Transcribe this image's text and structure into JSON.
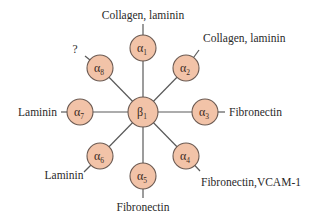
{
  "diagram": {
    "title": "",
    "colors": {
      "node_fill": "#f2c3a8",
      "node_stroke": "#6b5a52",
      "edge": "#5a5a5a",
      "text": "#2a2a2a"
    },
    "center": {
      "id": "beta1",
      "symbol": "β",
      "subscript": "1",
      "x": 143,
      "y": 112
    },
    "subunits": [
      {
        "id": "alpha1",
        "symbol": "α",
        "subscript": "1",
        "x": 143,
        "y": 48,
        "ligand": "Collagen, laminin",
        "lx": 143,
        "ly": 19,
        "anchor": "middle",
        "tx": 143,
        "ty": 24
      },
      {
        "id": "alpha2",
        "symbol": "α",
        "subscript": "2",
        "x": 186,
        "y": 68,
        "ligand": "Collagen, laminin",
        "lx": 203,
        "ly": 42,
        "anchor": "start",
        "tx": 199,
        "ty": 50
      },
      {
        "id": "alpha3",
        "symbol": "α",
        "subscript": "3",
        "x": 205,
        "y": 112,
        "ligand": "Fibronectin",
        "lx": 229,
        "ly": 116,
        "anchor": "start",
        "tx": 225,
        "ty": 112
      },
      {
        "id": "alpha4",
        "symbol": "α",
        "subscript": "4",
        "x": 186,
        "y": 156,
        "ligand": "Fibronectin,VCAM-1",
        "lx": 201,
        "ly": 186,
        "anchor": "start",
        "tx": 200,
        "ty": 171
      },
      {
        "id": "alpha5",
        "symbol": "α",
        "subscript": "5",
        "x": 143,
        "y": 176,
        "ligand": "Fibronectin",
        "lx": 143,
        "ly": 211,
        "anchor": "middle",
        "tx": 143,
        "ty": 198
      },
      {
        "id": "alpha6",
        "symbol": "α",
        "subscript": "6",
        "x": 100,
        "y": 156,
        "ligand": "Laminin",
        "lx": 64,
        "ly": 179,
        "anchor": "middle",
        "tx": 84,
        "ty": 172
      },
      {
        "id": "alpha7",
        "symbol": "α",
        "subscript": "7",
        "x": 80,
        "y": 112,
        "ligand": "Laminin",
        "lx": 57,
        "ly": 116,
        "anchor": "end",
        "tx": 61,
        "ty": 112
      },
      {
        "id": "alpha8",
        "symbol": "α",
        "subscript": "8",
        "x": 100,
        "y": 68,
        "ligand": "?",
        "lx": 75,
        "ly": 53,
        "anchor": "middle",
        "tx": 85,
        "ty": 56
      }
    ],
    "node_radius": 13
  }
}
